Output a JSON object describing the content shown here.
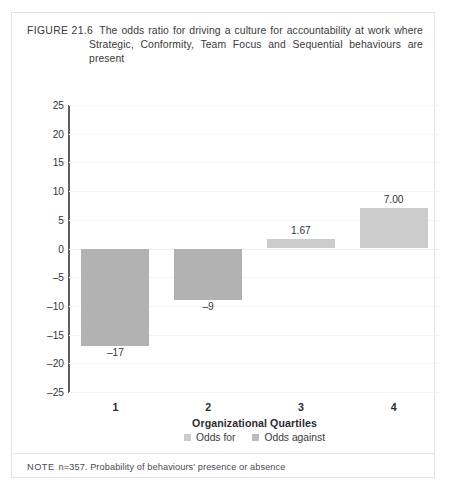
{
  "figure": {
    "label": "FIGURE 21.6",
    "caption": "The odds ratio for driving a culture for accountability at work where Strategic, Conformity, Team Focus and Sequential behaviours are present",
    "note_label": "NOTE",
    "note_text": "n=357. Probability of behaviours' presence or absence"
  },
  "colors": {
    "bar_negative": "#b2b2b2",
    "bar_positive": "#cccccc",
    "axis": "#5d5d63",
    "grid": "#f4f4f6",
    "border": "#e3e3e3"
  },
  "chart_data": {
    "type": "bar",
    "title": "The odds ratio for driving a culture for accountability at work where Strategic, Conformity, Team Focus and Sequential behaviours are present",
    "xlabel": "Organizational Quartiles",
    "ylabel": "",
    "categories": [
      "1",
      "2",
      "3",
      "4"
    ],
    "values": [
      -17,
      -9,
      1.67,
      7.0
    ],
    "data_labels": [
      "–17",
      "–9",
      "1.67",
      "7.00"
    ],
    "ylim": [
      -25,
      25
    ],
    "yticks": [
      25,
      20,
      15,
      10,
      5,
      0,
      -5,
      -10,
      -15,
      -20,
      -25
    ],
    "ytick_labels": [
      "25",
      "20",
      "15",
      "10",
      "5",
      "0",
      "–5",
      "–10",
      "–15",
      "–20",
      "–25"
    ],
    "grid": true,
    "legend_position": "bottom",
    "legend": [
      {
        "label": "Odds for",
        "color": "#cccccc"
      },
      {
        "label": "Odds against",
        "color": "#bdbdbd"
      }
    ],
    "series": [
      {
        "name": "Odds ratio",
        "values": [
          -17,
          -9,
          1.67,
          7.0
        ]
      }
    ]
  }
}
